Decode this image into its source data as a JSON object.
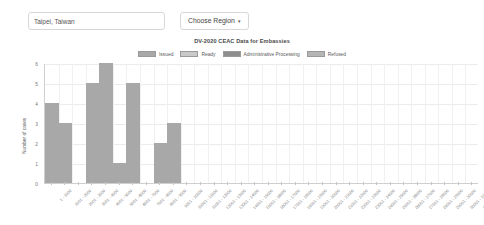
{
  "controls": {
    "region_input_value": "Taipei, Taiwan",
    "region_input_placeholder": "Enter Embassy",
    "choose_region_label": "Choose Region",
    "caret_glyph": "▾"
  },
  "chart_data": {
    "type": "bar",
    "title": "DV-2020 CEAC Data for Embassies",
    "xlabel": "",
    "ylabel": "Number of cases",
    "ylim": [
      0,
      6
    ],
    "yticks": [
      0,
      1,
      2,
      3,
      4,
      5,
      6
    ],
    "grid": true,
    "legend_position": "top-center",
    "legend": [
      {
        "label": "Issued",
        "color": "#a8a8a8"
      },
      {
        "label": "Ready",
        "color": "#c9c9c9"
      },
      {
        "label": "Administrative Processing",
        "color": "#8e8e8e"
      },
      {
        "label": "Refused",
        "color": "#b5b5b5"
      }
    ],
    "categories": [
      "1 - 1000",
      "1001 - 2000",
      "2001 - 3000",
      "3001 - 4000",
      "4001 - 5000",
      "5001 - 6000",
      "6001 - 7000",
      "7001 - 8000",
      "8001 - 9000",
      "9001 - 10000",
      "10001 - 11000",
      "11001 - 12000",
      "12001 - 13000",
      "13001 - 14000",
      "14001 - 15000",
      "15001 - 16000",
      "16001 - 17000",
      "17001 - 18000",
      "18001 - 19000",
      "19001 - 20000",
      "20001 - 21000",
      "21001 - 22000",
      "22001 - 23000",
      "23001 - 24000",
      "24001 - 25000",
      "25001 - 26000",
      "26001 - 27000",
      "27001 - 28000",
      "28001 - 29000",
      "29001 - 30000",
      "30001 - 31000",
      "31001 - 32000"
    ],
    "values": [
      4,
      3,
      0,
      5,
      6,
      1,
      5,
      0,
      2,
      3,
      0,
      0,
      0,
      0,
      0,
      0,
      0,
      0,
      0,
      0,
      0,
      0,
      0,
      0,
      0,
      0,
      0,
      0,
      0,
      0,
      0,
      0
    ],
    "bar_color": "#a8a8a8"
  }
}
